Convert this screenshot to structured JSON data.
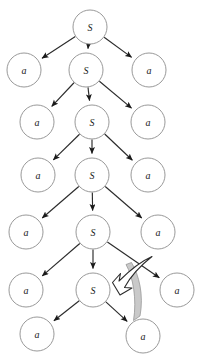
{
  "diagram": {
    "type": "parse-tree",
    "title": "",
    "colors": {
      "node_stroke": "#8d8d8d",
      "node_fill": "#ffffff",
      "edge": "#2b2b2b",
      "highlight_band": "#c9c9c9",
      "hollow_arrow_fill": "#ffffff",
      "label_text": "#1a1a1a",
      "background": "#ffffff"
    },
    "node_radius": 17,
    "levels": [
      {
        "index": 0,
        "nodes": [
          {
            "id": "S0",
            "label": "S",
            "cx": 90,
            "cy": 27,
            "kind": "nonterminal"
          }
        ]
      },
      {
        "index": 1,
        "nodes": [
          {
            "id": "a1L",
            "label": "a",
            "cx": 24,
            "cy": 70,
            "kind": "terminal"
          },
          {
            "id": "S1",
            "label": "S",
            "cx": 86,
            "cy": 70,
            "kind": "nonterminal"
          },
          {
            "id": "a1R",
            "label": "a",
            "cx": 149,
            "cy": 70,
            "kind": "terminal"
          }
        ]
      },
      {
        "index": 2,
        "nodes": [
          {
            "id": "a2L",
            "label": "a",
            "cx": 37,
            "cy": 122,
            "kind": "terminal"
          },
          {
            "id": "S2",
            "label": "S",
            "cx": 92,
            "cy": 122,
            "kind": "nonterminal"
          },
          {
            "id": "a2R",
            "label": "a",
            "cx": 148,
            "cy": 122,
            "kind": "terminal"
          }
        ]
      },
      {
        "index": 3,
        "nodes": [
          {
            "id": "a3L",
            "label": "a",
            "cx": 38,
            "cy": 175,
            "kind": "terminal"
          },
          {
            "id": "S3",
            "label": "S",
            "cx": 92,
            "cy": 175,
            "kind": "nonterminal"
          },
          {
            "id": "a3R",
            "label": "a",
            "cx": 148,
            "cy": 175,
            "kind": "terminal"
          }
        ]
      },
      {
        "index": 4,
        "nodes": [
          {
            "id": "a4L",
            "label": "a",
            "cx": 26,
            "cy": 232,
            "kind": "terminal"
          },
          {
            "id": "S4",
            "label": "S",
            "cx": 93,
            "cy": 232,
            "kind": "nonterminal"
          },
          {
            "id": "a4R",
            "label": "a",
            "cx": 158,
            "cy": 232,
            "kind": "terminal"
          }
        ]
      },
      {
        "index": 5,
        "nodes": [
          {
            "id": "a5L",
            "label": "a",
            "cx": 26,
            "cy": 290,
            "kind": "terminal"
          },
          {
            "id": "S5",
            "label": "S",
            "cx": 93,
            "cy": 290,
            "kind": "nonterminal"
          },
          {
            "id": "a5R",
            "label": "a",
            "cx": 177,
            "cy": 290,
            "kind": "terminal"
          }
        ]
      },
      {
        "index": 6,
        "nodes": [
          {
            "id": "a6L",
            "label": "a",
            "cx": 37,
            "cy": 334,
            "kind": "terminal"
          },
          {
            "id": "a6R",
            "label": "a",
            "cx": 143,
            "cy": 336,
            "kind": "terminal"
          }
        ]
      }
    ],
    "edges": [
      {
        "from": "S0",
        "to": "a1L"
      },
      {
        "from": "S0",
        "to": "S1"
      },
      {
        "from": "S0",
        "to": "a1R"
      },
      {
        "from": "S1",
        "to": "a2L"
      },
      {
        "from": "S1",
        "to": "S2"
      },
      {
        "from": "S1",
        "to": "a2R"
      },
      {
        "from": "S2",
        "to": "a3L"
      },
      {
        "from": "S2",
        "to": "S3"
      },
      {
        "from": "S2",
        "to": "a3R"
      },
      {
        "from": "S3",
        "to": "a4L"
      },
      {
        "from": "S3",
        "to": "S4"
      },
      {
        "from": "S3",
        "to": "a4R"
      },
      {
        "from": "S4",
        "to": "a5L"
      },
      {
        "from": "S4",
        "to": "S5"
      },
      {
        "from": "S4",
        "to": "a5R"
      },
      {
        "from": "S5",
        "to": "a6L"
      },
      {
        "from": "S5",
        "to": "a6R"
      }
    ],
    "annotations": {
      "hollow_arrow": {
        "name": "recursion-hollow-arrow",
        "description": "large outlined white arrow curving from upper right back into the bottom S node",
        "points_to": "S5"
      },
      "highlight_band": {
        "name": "highlight-band",
        "description": "gray shaded crescent alongside the edge from S5 to the bottom right a",
        "along_edge": "S5-a6R",
        "color": "#c9c9c9"
      }
    }
  }
}
